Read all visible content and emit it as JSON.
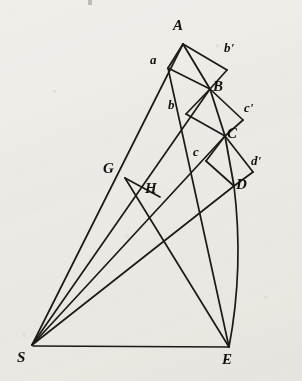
{
  "figure": {
    "kind": "geometric-diagram",
    "background_color": "#efeeea",
    "ink_color": "#1c1a18",
    "width": 302,
    "height": 381
  },
  "labels": {
    "A": "A",
    "B": "B",
    "C": "C",
    "D": "D",
    "E": "E",
    "G": "G",
    "H": "H",
    "S": "S",
    "a": "a",
    "b": "b",
    "c": "c",
    "b_prime": "b'",
    "c_prime": "c'",
    "d_prime": "d'"
  },
  "points": {
    "A": {
      "x": 183,
      "y": 44
    },
    "B": {
      "x": 210,
      "y": 89
    },
    "C": {
      "x": 225,
      "y": 136
    },
    "D": {
      "x": 234,
      "y": 186
    },
    "E": {
      "x": 229,
      "y": 347
    },
    "S": {
      "x": 32,
      "y": 345
    },
    "G": {
      "x": 125,
      "y": 178
    },
    "H": {
      "x": 158,
      "y": 196
    },
    "a": {
      "x": 168,
      "y": 68
    },
    "b": {
      "x": 186,
      "y": 114
    },
    "c": {
      "x": 206,
      "y": 161
    },
    "b'": {
      "x": 227,
      "y": 70
    },
    "c'": {
      "x": 243,
      "y": 120
    },
    "d'": {
      "x": 253,
      "y": 172
    }
  },
  "label_positions": {
    "A": {
      "x": 173,
      "y": 18
    },
    "B": {
      "x": 213,
      "y": 79
    },
    "C": {
      "x": 226,
      "y": 126
    },
    "D": {
      "x": 235,
      "y": 177
    },
    "E": {
      "x": 222,
      "y": 352
    },
    "G": {
      "x": 102,
      "y": 160
    },
    "H": {
      "x": 145,
      "y": 180
    },
    "S": {
      "x": 18,
      "y": 350
    },
    "a": {
      "x": 151,
      "y": 52
    },
    "b": {
      "x": 168,
      "y": 97
    },
    "c": {
      "x": 193,
      "y": 144
    },
    "b_prime": {
      "x": 225,
      "y": 40
    },
    "c_prime": {
      "x": 245,
      "y": 100
    },
    "d_prime": {
      "x": 252,
      "y": 153
    }
  },
  "segments": [
    {
      "name": "radius-S-to-A",
      "from": "S",
      "to": "A"
    },
    {
      "name": "radius-S-to-B",
      "from": "S",
      "to": "B"
    },
    {
      "name": "radius-S-to-C",
      "from": "S",
      "to": "C"
    },
    {
      "name": "radius-S-to-D",
      "from": "S",
      "to": "D"
    },
    {
      "name": "baseline-S-to-E",
      "from": "S",
      "to": "E"
    },
    {
      "name": "chord-A-to-B",
      "from": "A",
      "to": "B"
    },
    {
      "name": "chord-B-to-C",
      "from": "B",
      "to": "C"
    },
    {
      "name": "chord-C-to-D",
      "from": "C",
      "to": "D"
    },
    {
      "name": "tangent-A-to-a",
      "from": "A",
      "to": "a"
    },
    {
      "name": "tangent-B-to-b",
      "from": "B",
      "to": "b"
    },
    {
      "name": "tangent-C-to-c",
      "from": "C",
      "to": "c"
    },
    {
      "name": "parallel-a-to-B",
      "from": "a",
      "to": "B"
    },
    {
      "name": "parallel-b-to-C",
      "from": "b",
      "to": "C"
    },
    {
      "name": "parallel-c-to-D",
      "from": "c",
      "to": "D"
    },
    {
      "name": "parallelogram-A-to-bprime",
      "from": "A",
      "to": "b'"
    },
    {
      "name": "parallelogram-bprime-to-B",
      "from": "b'",
      "to": "B"
    },
    {
      "name": "parallelogram-B-to-cprime",
      "from": "B",
      "to": "c'"
    },
    {
      "name": "parallelogram-cprime-to-C",
      "from": "c'",
      "to": "C"
    },
    {
      "name": "parallelogram-C-to-dprime",
      "from": "C",
      "to": "d'"
    },
    {
      "name": "parallelogram-dprime-to-D",
      "from": "d'",
      "to": "D"
    },
    {
      "name": "segment-G-to-H",
      "from": "G",
      "to": "H"
    },
    {
      "name": "segment-a-to-H-extension",
      "from": "a",
      "to": "H"
    },
    {
      "name": "curve-D-to-E",
      "from": "D",
      "to": "E"
    }
  ]
}
